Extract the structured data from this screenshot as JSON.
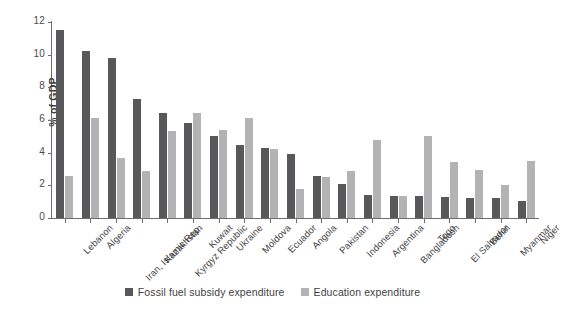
{
  "chart_data": {
    "type": "bar",
    "title": "",
    "xlabel": "",
    "ylabel": "% of GDP",
    "ylim": [
      0,
      12
    ],
    "yticks": [
      0,
      2,
      4,
      6,
      8,
      10,
      12
    ],
    "grid": false,
    "legend_position": "bottom-center",
    "categories": [
      "Lebanon",
      "Algeria",
      "Iran, Islamic Rep.",
      "Kazakhstan",
      "Kyrgyz Republic",
      "Kuwait",
      "Ukraine",
      "Moldova",
      "Ecuador",
      "Angola",
      "Pakistan",
      "Indonesia",
      "Argentina",
      "Bangladesh",
      "Togo",
      "El Salvador",
      "Benin",
      "Myanmar",
      "Niger"
    ],
    "series": [
      {
        "name": "Fossil fuel subsidy expenditure",
        "color": "#58585b",
        "values": [
          11.5,
          10.2,
          9.8,
          7.3,
          6.45,
          5.8,
          5.0,
          4.45,
          4.3,
          3.9,
          2.55,
          2.1,
          1.4,
          1.35,
          1.35,
          1.3,
          1.25,
          1.2,
          1.05
        ]
      },
      {
        "name": "Education expenditure",
        "color": "#b3b3b3",
        "values": [
          2.55,
          6.1,
          3.65,
          2.85,
          5.35,
          6.45,
          5.4,
          6.1,
          4.25,
          1.8,
          2.5,
          2.9,
          4.8,
          1.35,
          5.05,
          3.4,
          2.95,
          2.0,
          3.5
        ]
      }
    ]
  },
  "axis": {
    "y_title": "% of GDP"
  },
  "legend": {
    "items": [
      {
        "label": "Fossil fuel subsidy expenditure",
        "color": "#58585b"
      },
      {
        "label": "Education expenditure",
        "color": "#b3b3b3"
      }
    ]
  },
  "caption_sliver": ""
}
